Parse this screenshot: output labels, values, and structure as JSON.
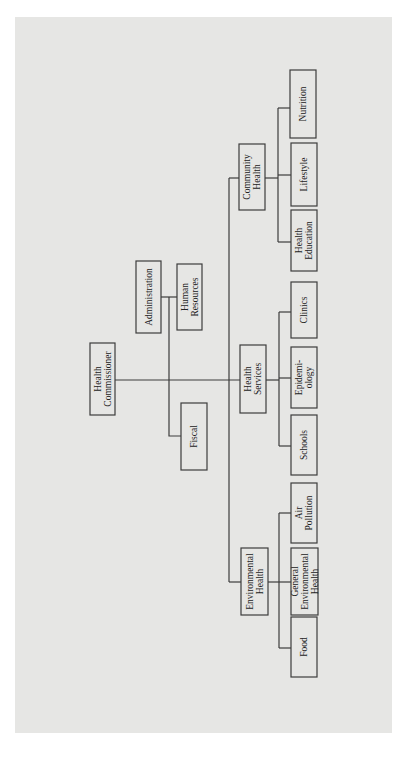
{
  "diagram": {
    "type": "org-chart",
    "orientation": "rotated-90-ccw",
    "nodes": [
      {
        "id": "commissioner",
        "lines": [
          "Health",
          "Commissioner"
        ]
      },
      {
        "id": "administration",
        "lines": [
          "Administration"
        ],
        "parent": "commissioner"
      },
      {
        "id": "human-resources",
        "lines": [
          "Human",
          "Resources"
        ],
        "parent": "administration"
      },
      {
        "id": "fiscal",
        "lines": [
          "Fiscal"
        ],
        "parent": "commissioner"
      },
      {
        "id": "environmental-health",
        "lines": [
          "Environmental",
          "Health"
        ],
        "parent": "commissioner"
      },
      {
        "id": "health-services",
        "lines": [
          "Health",
          "Services"
        ],
        "parent": "commissioner"
      },
      {
        "id": "community-health",
        "lines": [
          "Community",
          "Health"
        ],
        "parent": "commissioner"
      },
      {
        "id": "food",
        "lines": [
          "Food"
        ],
        "parent": "environmental-health"
      },
      {
        "id": "general-environmental-health",
        "lines": [
          "General",
          "Environmental",
          "Health"
        ],
        "parent": "environmental-health"
      },
      {
        "id": "air-pollution",
        "lines": [
          "Air",
          "Pollution"
        ],
        "parent": "environmental-health"
      },
      {
        "id": "schools",
        "lines": [
          "Schools"
        ],
        "parent": "health-services"
      },
      {
        "id": "epidemiology",
        "lines": [
          "Epidemi-",
          "ology"
        ],
        "parent": "health-services"
      },
      {
        "id": "clinics",
        "lines": [
          "Clinics"
        ],
        "parent": "health-services"
      },
      {
        "id": "health-education",
        "lines": [
          "Health",
          "Education"
        ],
        "parent": "community-health"
      },
      {
        "id": "lifestyle",
        "lines": [
          "Lifestyle"
        ],
        "parent": "community-health"
      },
      {
        "id": "nutrition",
        "lines": [
          "Nutrition"
        ],
        "parent": "community-health"
      }
    ]
  }
}
